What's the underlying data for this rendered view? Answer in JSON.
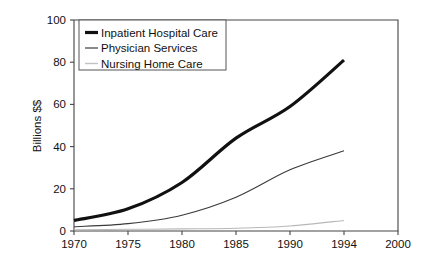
{
  "chart_data": {
    "type": "line",
    "title": "",
    "xlabel": "",
    "ylabel": "Billions $$",
    "xlim": [
      1970,
      2000
    ],
    "ylim": [
      0,
      100
    ],
    "grid": false,
    "legend_position": "top-left",
    "x_tick_labels": [
      "1970",
      "1975",
      "1980",
      "1985",
      "1990",
      "1994",
      "2000"
    ],
    "x_tick_values": [
      1970,
      1975,
      1980,
      1985,
      1990,
      1994,
      2000
    ],
    "y_tick_labels": [
      "0",
      "20",
      "40",
      "60",
      "80",
      "100"
    ],
    "y_tick_values": [
      0,
      20,
      40,
      60,
      80,
      100
    ],
    "x": [
      1970,
      1975,
      1980,
      1985,
      1990,
      1994
    ],
    "series": [
      {
        "name": "Inpatient Hospital Care",
        "values": [
          5,
          10.5,
          23,
          44,
          59,
          81
        ],
        "color": "#111111",
        "width": 3.2
      },
      {
        "name": "Physician Services",
        "values": [
          2,
          3.5,
          7.5,
          16,
          29,
          38
        ],
        "color": "#3a3a3a",
        "width": 1.1
      },
      {
        "name": "Nursing Home Care",
        "values": [
          0.6,
          0.8,
          1,
          1.3,
          2.4,
          5
        ],
        "color": "#b8b8b8",
        "width": 1.1
      }
    ]
  },
  "legend": {
    "items": [
      {
        "label": "Inpatient Hospital Care"
      },
      {
        "label": "Physician Services"
      },
      {
        "label": "Nursing Home Care"
      }
    ]
  },
  "axis": {
    "y_title": "Billions $$"
  }
}
